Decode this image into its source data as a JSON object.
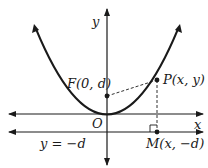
{
  "diagram": {
    "type": "parabola-focus-directrix",
    "colors": {
      "ink": "#1a1a1a",
      "background": "#ffffff"
    },
    "labels": {
      "y_axis": "y",
      "x_axis": "x",
      "origin": "O",
      "focus": "F(0, d)",
      "point": "P(x, y)",
      "foot": "M(x, −d)",
      "directrix": "y = −d"
    }
  }
}
